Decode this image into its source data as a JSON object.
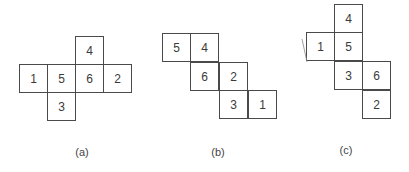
{
  "diagram": {
    "cell_size": 28,
    "nets": [
      {
        "id": "a",
        "label": "(a)",
        "label_pos": {
          "x": 82,
          "y": 146
        },
        "cells": [
          {
            "n": "4",
            "x": 75,
            "y": 36
          },
          {
            "n": "1",
            "x": 19,
            "y": 64
          },
          {
            "n": "5",
            "x": 47,
            "y": 64
          },
          {
            "n": "6",
            "x": 75,
            "y": 64
          },
          {
            "n": "2",
            "x": 103,
            "y": 64
          },
          {
            "n": "3",
            "x": 47,
            "y": 92
          }
        ]
      },
      {
        "id": "b",
        "label": "(b)",
        "label_pos": {
          "x": 218,
          "y": 146
        },
        "cells": [
          {
            "n": "5",
            "x": 162,
            "y": 33
          },
          {
            "n": "4",
            "x": 190,
            "y": 33
          },
          {
            "n": "6",
            "x": 190,
            "y": 62
          },
          {
            "n": "2",
            "x": 219,
            "y": 62
          },
          {
            "n": "3",
            "x": 219,
            "y": 90
          },
          {
            "n": "1",
            "x": 248,
            "y": 90
          }
        ]
      },
      {
        "id": "c",
        "label": "(c)",
        "label_pos": {
          "x": 346,
          "y": 144
        },
        "cells": [
          {
            "n": "4",
            "x": 334,
            "y": 4
          },
          {
            "n": "1",
            "x": 306,
            "y": 32
          },
          {
            "n": "5",
            "x": 334,
            "y": 32
          },
          {
            "n": "3",
            "x": 334,
            "y": 61
          },
          {
            "n": "6",
            "x": 362,
            "y": 61
          },
          {
            "n": "2",
            "x": 362,
            "y": 90
          }
        ],
        "stray_mark": {
          "x1": 302,
          "y1": 39,
          "x2": 307,
          "y2": 62
        }
      }
    ]
  }
}
